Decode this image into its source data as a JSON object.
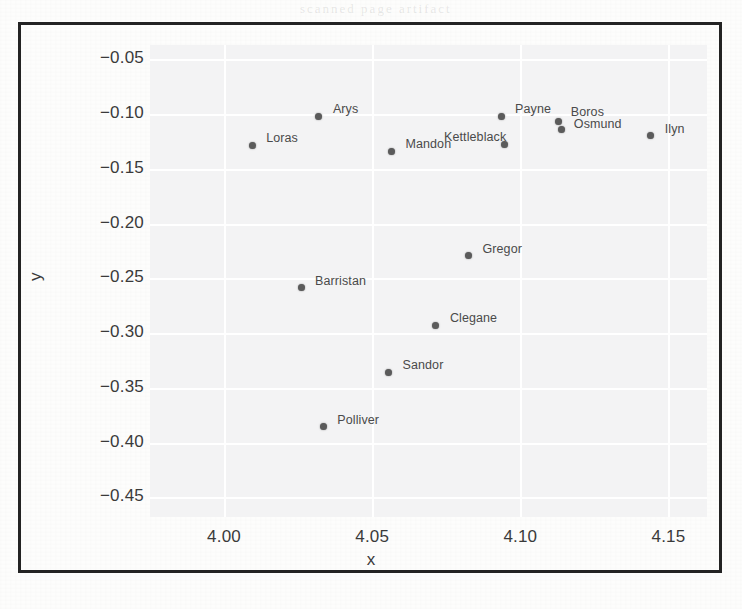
{
  "figure": {
    "kind": "scatter-plot-scan",
    "frame_color": "#232323",
    "panel_color": "#ececee",
    "point_color": "#5b5b5b",
    "label_color": "#4a4a4a"
  },
  "ghost_text": {
    "line_1": "of the world we come",
    "line_2": "scanned page artifact"
  },
  "chart_data": {
    "type": "scatter",
    "title": "",
    "xlabel": "x",
    "ylabel": "y",
    "xlim": [
      3.975,
      4.163
    ],
    "ylim": [
      -0.468,
      -0.037
    ],
    "xticks": [
      "4.00",
      "4.05",
      "4.10",
      "4.15"
    ],
    "xtick_values": [
      4.0,
      4.05,
      4.1,
      4.15
    ],
    "yticks": [
      "−0.05",
      "−0.10",
      "−0.15",
      "−0.20",
      "−0.25",
      "−0.30",
      "−0.35",
      "−0.40",
      "−0.45"
    ],
    "ytick_values": [
      -0.05,
      -0.1,
      -0.15,
      -0.2,
      -0.25,
      -0.3,
      -0.35,
      -0.4,
      -0.45
    ],
    "grid": true,
    "legend": false,
    "points": [
      {
        "label": "Loras",
        "x": 4.0095,
        "y": -0.1285,
        "label_dx": 14,
        "label_dy": -14
      },
      {
        "label": "Arys",
        "x": 4.032,
        "y": -0.102,
        "label_dx": 14,
        "label_dy": -14
      },
      {
        "label": "Mandon",
        "x": 4.0565,
        "y": -0.134,
        "label_dx": 14,
        "label_dy": -14
      },
      {
        "label": "Payne",
        "x": 4.0935,
        "y": -0.102,
        "label_dx": 14,
        "label_dy": -14
      },
      {
        "label": "Kettleblack",
        "x": 4.0945,
        "y": -0.1275,
        "label_dx": -60,
        "label_dy": -14
      },
      {
        "label": "Boros",
        "x": 4.113,
        "y": -0.107,
        "label_dx": 12,
        "label_dy": -17
      },
      {
        "label": "Osmund",
        "x": 4.114,
        "y": -0.1145,
        "label_dx": 12,
        "label_dy": -13
      },
      {
        "label": "Ilyn",
        "x": 4.144,
        "y": -0.1195,
        "label_dx": 14,
        "label_dy": -13
      },
      {
        "label": "Gregor",
        "x": 4.0825,
        "y": -0.2295,
        "label_dx": 14,
        "label_dy": -14
      },
      {
        "label": "Barristan",
        "x": 4.026,
        "y": -0.2585,
        "label_dx": 14,
        "label_dy": -14
      },
      {
        "label": "Clegane",
        "x": 4.0715,
        "y": -0.293,
        "label_dx": 14,
        "label_dy": -14
      },
      {
        "label": "Sandor",
        "x": 4.0555,
        "y": -0.336,
        "label_dx": 14,
        "label_dy": -14
      },
      {
        "label": "Polliver",
        "x": 4.0335,
        "y": -0.3855,
        "label_dx": 14,
        "label_dy": -14
      }
    ]
  }
}
